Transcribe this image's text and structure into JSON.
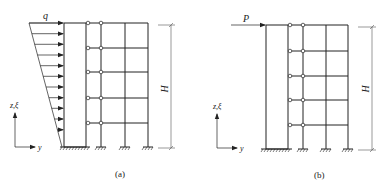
{
  "figure": {
    "panels": [
      {
        "id": "a",
        "caption": "(a)",
        "load_type": "triangular distributed load",
        "load_label": "q",
        "height_label": "H",
        "axis_vertical_label": "z,ξ",
        "axis_horizontal_label": "y",
        "stories": 5,
        "bays": 3,
        "hinged_links": "pin-connected links between wall and frame at each floor"
      },
      {
        "id": "b",
        "caption": "(b)",
        "load_type": "concentrated load at top",
        "load_label": "P",
        "height_label": "H",
        "axis_vertical_label": "z,ξ",
        "axis_horizontal_label": "y",
        "stories": 5,
        "bays": 3,
        "hinged_links": "pin-connected links between wall and frame at each floor"
      }
    ],
    "colors": {
      "line": "#222222",
      "dim_line": "#555555",
      "background": "#ffffff"
    }
  }
}
